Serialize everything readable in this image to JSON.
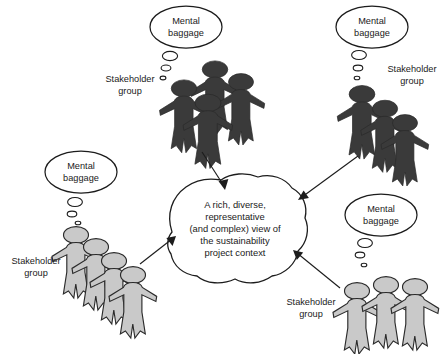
{
  "figure": {
    "type": "stakeholder-diagram",
    "center": {
      "lines": [
        "A rich, diverse,",
        "representative",
        "(and complex) view of",
        "the sustainability",
        "project context"
      ]
    },
    "colors": {
      "dark_figure": "#3a3a3a",
      "light_figure": "#c9c9c9",
      "outline": "#1c1c1c",
      "text": "#1a1a1a",
      "background": "#ffffff"
    },
    "groups": [
      {
        "id": "top-left",
        "group_label": [
          "Stakeholder",
          "group"
        ],
        "baggage_label": [
          "Mental",
          "baggage"
        ],
        "figure_count": 4,
        "figure_shade": "dark"
      },
      {
        "id": "top-right",
        "group_label": [
          "Stakeholder",
          "group"
        ],
        "baggage_label": [
          "Mental",
          "baggage"
        ],
        "figure_count": 3,
        "figure_shade": "dark"
      },
      {
        "id": "bottom-left",
        "group_label": [
          "Stakeholder",
          "group"
        ],
        "baggage_label": [
          "Mental",
          "baggage"
        ],
        "figure_count": 4,
        "figure_shade": "light"
      },
      {
        "id": "bottom-right",
        "group_label": [
          "Stakeholder",
          "group"
        ],
        "baggage_label": [
          "Mental",
          "baggage"
        ],
        "figure_count": 3,
        "figure_shade": "light"
      }
    ],
    "arrows": [
      {
        "from": "top-left",
        "to": "center"
      },
      {
        "from": "top-right",
        "to": "center"
      },
      {
        "from": "bottom-left",
        "to": "center"
      },
      {
        "from": "bottom-right",
        "to": "center"
      }
    ]
  }
}
